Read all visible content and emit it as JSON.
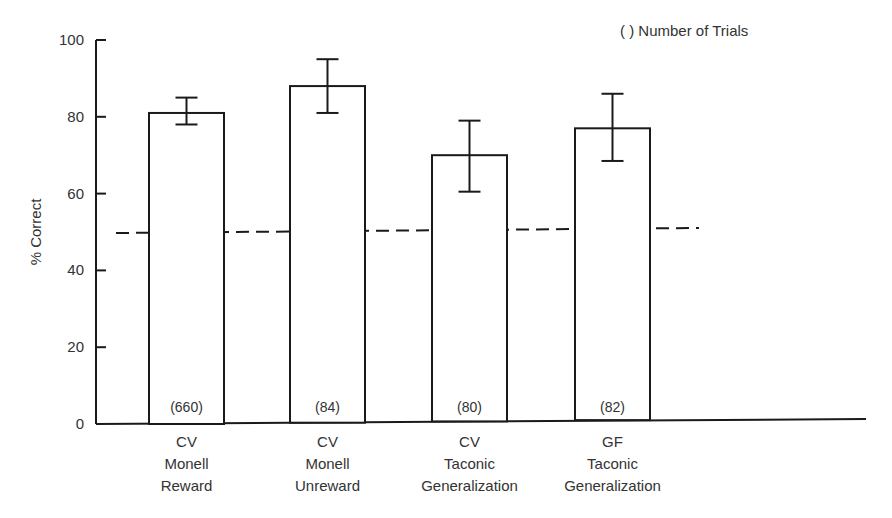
{
  "chart_data": {
    "type": "bar",
    "title": "",
    "xlabel": "",
    "ylabel": "% Correct",
    "ylim": [
      0,
      100
    ],
    "yticks": [
      0,
      20,
      40,
      60,
      80,
      100
    ],
    "grid": false,
    "legend_note": "(   ) Number of Trials",
    "categories": [
      [
        "CV",
        "Monell",
        "Reward"
      ],
      [
        "CV",
        "Monell",
        "Unreward"
      ],
      [
        "CV",
        "Taconic",
        "Generalization"
      ],
      [
        "GF",
        "Taconic",
        "Generalization"
      ]
    ],
    "values": [
      81,
      88,
      70,
      77
    ],
    "error_upper": [
      85,
      95,
      79,
      86
    ],
    "error_lower": [
      78,
      81,
      60.5,
      68.5
    ],
    "n_trials": [
      "(660)",
      "(84)",
      "(80)",
      "(82)"
    ],
    "reference_line": {
      "y": 50,
      "style": "dashed",
      "label": "chance"
    }
  }
}
